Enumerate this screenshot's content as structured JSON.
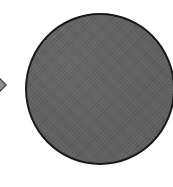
{
  "shapes": {
    "left_shape": {
      "type": "diamond",
      "fill": "#8e8e8e",
      "stroke": "#3a3a3a",
      "partially_visible": true
    },
    "main_shape": {
      "type": "circle",
      "fill": "#5d5d5d",
      "stroke": "#1a1a1a",
      "texture": "noise"
    }
  },
  "background": "#ffffff"
}
